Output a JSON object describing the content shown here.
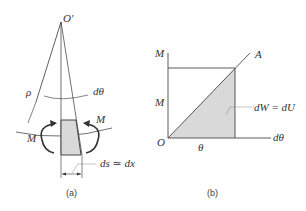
{
  "panel_a": {
    "caption": "(a)",
    "labels": {
      "center": "O'",
      "radius": "ρ",
      "angle": "dθ",
      "moment_left": "M",
      "moment_right": "M",
      "arc_length": "ds ≃ dx"
    }
  },
  "panel_b": {
    "caption": "(b)",
    "labels": {
      "y_axis": "M",
      "y_value": "M",
      "origin": "O",
      "x_axis": "dθ",
      "x_value": "θ",
      "line_end": "A",
      "area": "dW = dU"
    }
  },
  "colors": {
    "line": "#333333",
    "fill": "#d9d9d9"
  }
}
